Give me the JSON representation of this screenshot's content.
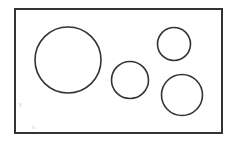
{
  "figure": {
    "background_color": "#ffffff",
    "stroke_color": "#333333",
    "label_color": "#c9c9c9",
    "canvas": {
      "width": 234,
      "height": 144
    },
    "frame": {
      "name": "bounding rectangle",
      "x": 15,
      "y": 9,
      "width": 207,
      "height": 124,
      "stroke_width": 2,
      "fill": "none"
    },
    "circles": [
      {
        "id": "circle-large",
        "label": "large circle",
        "cx": 68,
        "cy": 60,
        "r": 33,
        "stroke_width": 1.6,
        "fill": "none"
      },
      {
        "id": "circle-middle",
        "label": "middle circle",
        "cx": 130,
        "cy": 80,
        "r": 18.5,
        "stroke_width": 1.6,
        "fill": "none"
      },
      {
        "id": "circle-top-right",
        "label": "top right circle",
        "cx": 174,
        "cy": 44,
        "r": 16.5,
        "stroke_width": 1.6,
        "fill": "none"
      },
      {
        "id": "circle-bottom-right",
        "label": "bottom right circle",
        "cx": 182,
        "cy": 95,
        "r": 20.5,
        "stroke_width": 1.6,
        "fill": "none"
      }
    ],
    "axis_labels": {
      "y": {
        "text": "y",
        "x": 19,
        "y": 106
      },
      "x": {
        "text": "x",
        "x": 32,
        "y": 129
      }
    }
  }
}
